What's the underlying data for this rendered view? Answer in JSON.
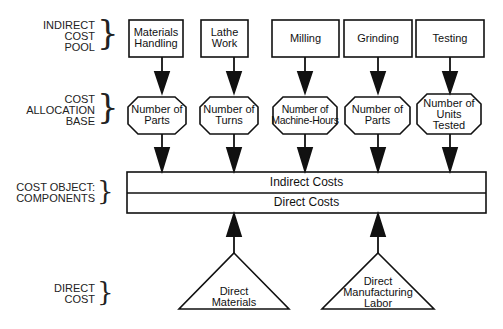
{
  "diagram": {
    "row_labels": {
      "indirect_cost_pool": [
        "INDIRECT",
        "COST",
        "POOL"
      ],
      "cost_allocation_base": [
        "COST",
        "ALLOCATION",
        "BASE"
      ],
      "cost_object": [
        "COST OBJECT:",
        "COMPONENTS"
      ],
      "direct_cost": [
        "DIRECT",
        "COST"
      ]
    },
    "cost_pools": [
      {
        "line1": "Materials",
        "line2": "Handling"
      },
      {
        "line1": "Lathe",
        "line2": "Work"
      },
      {
        "line1": "Milling",
        "line2": ""
      },
      {
        "line1": "Grinding",
        "line2": ""
      },
      {
        "line1": "Testing",
        "line2": ""
      }
    ],
    "allocation_bases": [
      {
        "line1": "Number of",
        "line2": "Parts",
        "line3": ""
      },
      {
        "line1": "Number of",
        "line2": "Turns",
        "line3": ""
      },
      {
        "line1": "Number of",
        "line2": "Machine-Hours",
        "line3": ""
      },
      {
        "line1": "Number of",
        "line2": "Parts",
        "line3": ""
      },
      {
        "line1": "Number of",
        "line2": "Units",
        "line3": "Tested"
      }
    ],
    "cost_object": {
      "indirect": "Indirect Costs",
      "direct": "Direct Costs"
    },
    "direct_costs": [
      {
        "line1": "Direct",
        "line2": "Materials",
        "line3": ""
      },
      {
        "line1": "Direct",
        "line2": "Manufacturing",
        "line3": "Labor"
      }
    ],
    "colors": {
      "stroke": "#111111",
      "fill": "#ffffff",
      "text": "#111111"
    }
  }
}
